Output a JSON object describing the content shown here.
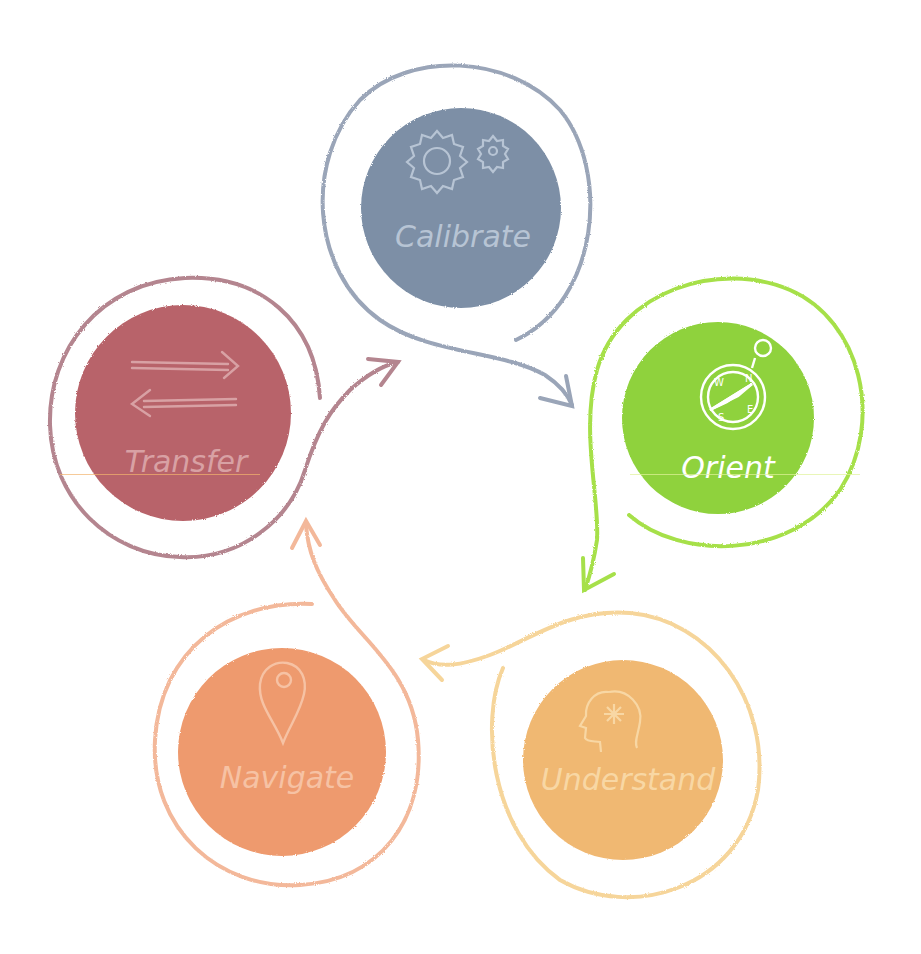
{
  "diagram": {
    "type": "cycle",
    "stages": [
      {
        "id": "calibrate",
        "label": "Calibrate",
        "icon": "gears-icon",
        "fill": "#7d8fa6",
        "ring": "#9aa5b8",
        "text": "#b7c4d4",
        "cx": 461,
        "cy": 208,
        "r": 100
      },
      {
        "id": "orient",
        "label": "Orient",
        "icon": "compass-icon",
        "fill": "#8fd23c",
        "ring": "#a6e04a",
        "text": "#ffffff",
        "cx": 718,
        "cy": 418,
        "r": 96
      },
      {
        "id": "understand",
        "label": "Understand",
        "icon": "head-mind-icon",
        "fill": "#f0b872",
        "ring": "#f6d59a",
        "text": "#f8d7a4",
        "cx": 623,
        "cy": 760,
        "r": 100
      },
      {
        "id": "navigate",
        "label": "Navigate",
        "icon": "map-pin-icon",
        "fill": "#ee9a6e",
        "ring": "#f3b89a",
        "text": "#f6c2a4",
        "cx": 282,
        "cy": 752,
        "r": 104
      },
      {
        "id": "transfer",
        "label": "Transfer",
        "icon": "transfer-arrows-icon",
        "fill": "#b8646a",
        "ring": "#b4858f",
        "text": "#d8a1a4",
        "cx": 183,
        "cy": 413,
        "r": 108
      }
    ],
    "flow": [
      "Calibrate",
      "Orient",
      "Understand",
      "Navigate",
      "Transfer",
      "Calibrate"
    ],
    "compass_letters": [
      "N",
      "E",
      "S",
      "W"
    ]
  }
}
